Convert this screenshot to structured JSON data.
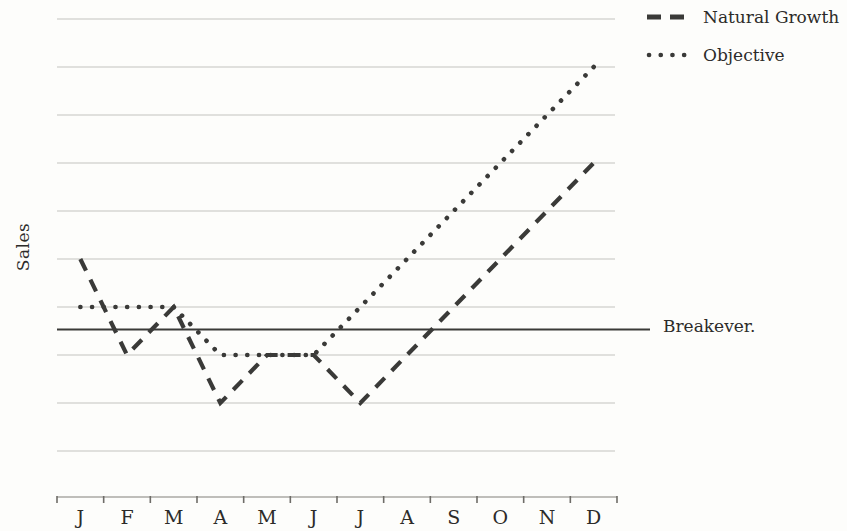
{
  "chart_data": {
    "type": "line",
    "title": "",
    "xlabel": "",
    "ylabel": "Sales",
    "categories": [
      "J",
      "F",
      "M",
      "A",
      "M",
      "J",
      "J",
      "A",
      "S",
      "O",
      "N",
      "D"
    ],
    "series": [
      {
        "name": "Natural Growth",
        "style": "dashed",
        "values": [
          5,
          3,
          4,
          2,
          3,
          3,
          2,
          3,
          4,
          5,
          6,
          7
        ]
      },
      {
        "name": "Objective",
        "style": "dotted",
        "values": [
          4,
          4,
          4,
          3,
          3,
          3,
          4,
          5,
          6,
          7,
          8,
          9
        ]
      }
    ],
    "breakeven": {
      "label": "Breakever.",
      "value": 3.5
    },
    "ylim": [
      0,
      10
    ],
    "gridline_values": [
      1,
      2,
      3,
      4,
      5,
      6,
      7,
      8,
      9,
      10
    ],
    "y_tick_labels_visible": false,
    "grid": true,
    "legend_position": "top-right",
    "x_axis_tick_count": 13
  },
  "colors": {
    "line": "#3a3a38",
    "grid": "#c4c3c0",
    "axis": "#aaa8a4",
    "tick": "#6e6c68",
    "text": "#2c2b29",
    "background": "#fdfdfb"
  }
}
